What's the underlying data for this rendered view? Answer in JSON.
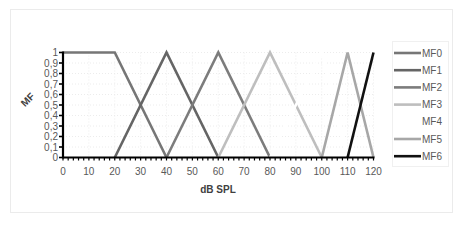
{
  "chart_data": {
    "type": "line",
    "title": "",
    "xlabel": "dB SPL",
    "ylabel": "MF",
    "xlim": [
      0,
      120
    ],
    "ylim": [
      0,
      1
    ],
    "x_ticks": [
      "0",
      "10",
      "20",
      "30",
      "40",
      "50",
      "60",
      "70",
      "80",
      "90",
      "100",
      "110",
      "120"
    ],
    "y_ticks": [
      "0",
      "0,1",
      "0,2",
      "0,3",
      "0,4",
      "0,5",
      "0,6",
      "0,7",
      "0,8",
      "0,9",
      "1"
    ],
    "grid": true,
    "legend_position": "right",
    "series": [
      {
        "name": "MF0",
        "color": "#767676",
        "x": [
          0,
          20,
          40
        ],
        "y": [
          1,
          1,
          0
        ]
      },
      {
        "name": "MF1",
        "color": "#656565",
        "x": [
          20,
          40,
          60
        ],
        "y": [
          0,
          1,
          0
        ]
      },
      {
        "name": "MF2",
        "color": "#7c7c7c",
        "x": [
          40,
          60,
          80
        ],
        "y": [
          0,
          1,
          0
        ]
      },
      {
        "name": "MF3",
        "color": "#bebebe",
        "x": [
          60,
          80,
          100
        ],
        "y": [
          0,
          1,
          0
        ]
      },
      {
        "name": "MF4",
        "color": "#ffffff",
        "x": [
          80,
          100,
          110
        ],
        "y": [
          0,
          1,
          0
        ]
      },
      {
        "name": "MF5",
        "color": "#a7a7a7",
        "x": [
          100,
          110,
          120
        ],
        "y": [
          0,
          1,
          0
        ]
      },
      {
        "name": "MF6",
        "color": "#111111",
        "x": [
          110,
          120
        ],
        "y": [
          0,
          1
        ]
      }
    ]
  }
}
